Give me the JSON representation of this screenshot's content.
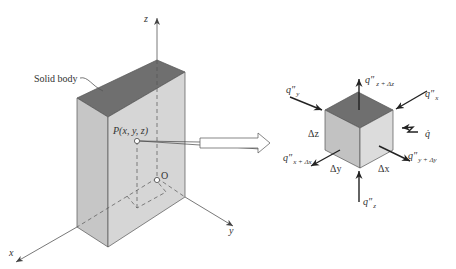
{
  "figure": {
    "type": "heat-conduction-control-volume",
    "colors": {
      "top_face": "#6f6f6f",
      "front_face": "#cfcfcf",
      "side_face": "#bdbdbd",
      "cube_right_face": "#e0e0e0",
      "background": "#ffffff"
    }
  },
  "solid": {
    "label": "Solid body",
    "point_label": "P(x, y, z)",
    "origin_label": "O",
    "axes": {
      "x": "x",
      "y": "y",
      "z": "z"
    }
  },
  "element": {
    "fluxes": {
      "qy": {
        "base": "q″",
        "sub": "y"
      },
      "qx": {
        "base": "q″",
        "sub": "x"
      },
      "qz_dz": {
        "base": "q″",
        "sub": "z + Δz"
      },
      "qx_dx": {
        "base": "q″",
        "sub": "x + Δx"
      },
      "qy_dy": {
        "base": "q″",
        "sub": "y + Δy"
      },
      "qz": {
        "base": "q″",
        "sub": "z"
      },
      "qgen": {
        "base": "q̇"
      }
    },
    "dimensions": {
      "dz": "Δz",
      "dy": "Δy",
      "dx": "Δx"
    }
  }
}
